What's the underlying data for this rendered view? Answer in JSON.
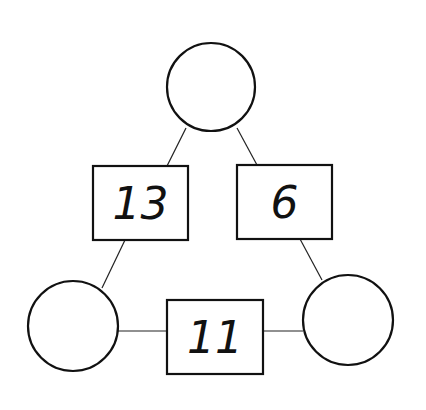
{
  "diagram": {
    "type": "arithmetic-triangle",
    "circles": [
      {
        "id": "top",
        "value": ""
      },
      {
        "id": "bottom-left",
        "value": ""
      },
      {
        "id": "bottom-right",
        "value": ""
      }
    ],
    "boxes": [
      {
        "id": "left",
        "value": "13"
      },
      {
        "id": "right",
        "value": "6"
      },
      {
        "id": "bottom",
        "value": "11"
      }
    ]
  }
}
